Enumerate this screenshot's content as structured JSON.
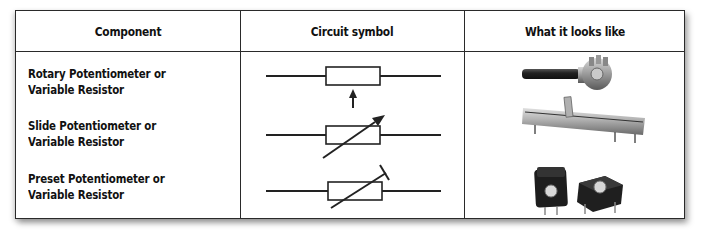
{
  "table": {
    "headers": [
      "Component",
      "Circuit symbol",
      "What it looks like"
    ],
    "rows": [
      {
        "component_line1": "Rotary Potentiometer or",
        "component_line2": "Variable Resistor",
        "symbol": "resistor-with-perpendicular-arrow-wiper",
        "photo": "rotary-potentiometer-photo"
      },
      {
        "component_line1": "Slide Potentiometer or",
        "component_line2": "Variable Resistor",
        "symbol": "resistor-with-diagonal-arrow",
        "photo": "slide-potentiometer-photo"
      },
      {
        "component_line1": "Preset Potentiometer or",
        "component_line2": "Variable Resistor",
        "symbol": "resistor-with-diagonal-t-bar",
        "photo": "preset-potentiometer-photo"
      }
    ]
  },
  "colors": {
    "border": "#2a2a2a",
    "text": "#111111",
    "background": "#ffffff"
  }
}
